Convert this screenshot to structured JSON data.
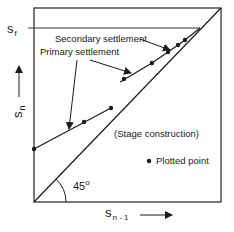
{
  "figure": {
    "labels": {
      "s_f_main": "s",
      "s_f_sub": "f",
      "y_axis_main": "s",
      "y_axis_sub": "n",
      "x_axis_main": "s",
      "x_axis_sub": "n - 1",
      "secondary_settlement": "Secondary settlement",
      "primary_settlement": "Primary settlement",
      "stage_construction": "(Stage construction)",
      "legend_plotted_point": "Plotted point",
      "angle_value": "45",
      "angle_unit": "o"
    },
    "colors": {
      "line": "#1a1a1a",
      "frame": "#333333",
      "background": "#ffffff"
    }
  }
}
